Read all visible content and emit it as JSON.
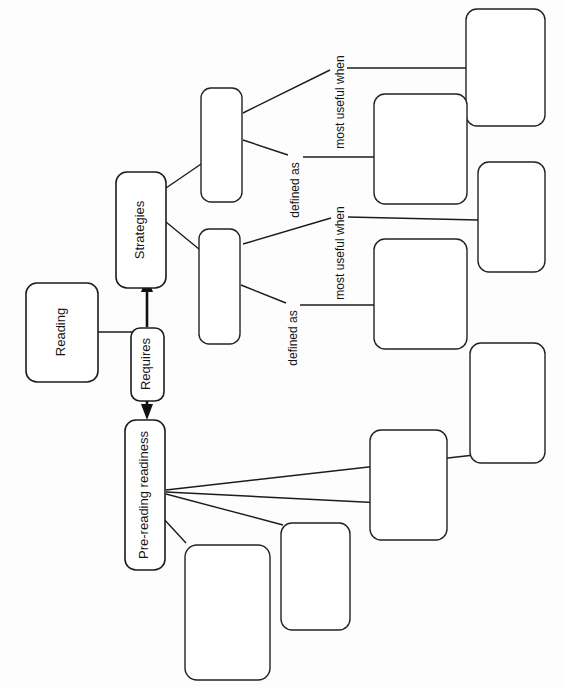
{
  "document": {
    "type": "concept-map-worksheet",
    "orientation": "rotated-90-counterclockwise",
    "background_color": "#fdfdfd",
    "ink_color": "#1c1c1c"
  },
  "nodes": {
    "reading": {
      "label": "Reading",
      "filled": true
    },
    "requires": {
      "label": "Requires",
      "filled": true
    },
    "strategies": {
      "label": "Strategies",
      "filled": true
    },
    "pre_reading_readiness": {
      "label": "Pre-reading readiness",
      "filled": true
    },
    "strategy_a": {
      "label": "",
      "filled": false
    },
    "strategy_b": {
      "label": "",
      "filled": false
    },
    "strategy_a_definition": {
      "label": "",
      "filled": false
    },
    "strategy_a_usefulness": {
      "label": "",
      "filled": false
    },
    "strategy_b_definition": {
      "label": "",
      "filled": false
    },
    "strategy_b_usefulness": {
      "label": "",
      "filled": false
    },
    "readiness_item_1": {
      "label": "",
      "filled": false
    },
    "readiness_item_2": {
      "label": "",
      "filled": false
    },
    "readiness_item_3": {
      "label": "",
      "filled": false
    },
    "readiness_item_4": {
      "label": "",
      "filled": false
    }
  },
  "edge_labels": {
    "defined_as_upper": "defined as",
    "most_useful_when_upper": "most useful when",
    "defined_as_lower": "defined as",
    "most_useful_when_lower": "most useful when"
  }
}
